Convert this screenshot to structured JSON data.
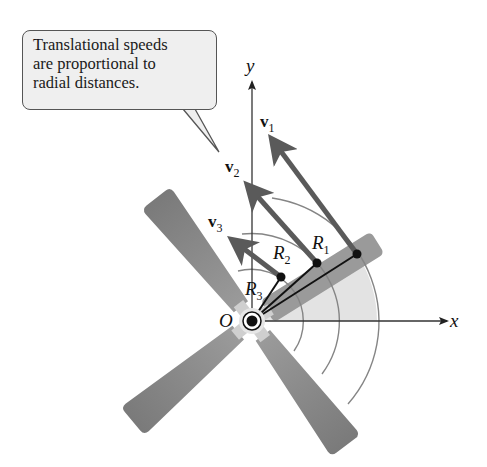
{
  "callout": {
    "lines": [
      "Translational speeds",
      "are proportional to",
      "radial distances."
    ]
  },
  "axes": {
    "x_label": "x",
    "y_label": "y",
    "origin_label": "O"
  },
  "vectors": [
    {
      "name": "v",
      "sub": "1"
    },
    {
      "name": "v",
      "sub": "2"
    },
    {
      "name": "v",
      "sub": "3"
    }
  ],
  "radii": [
    {
      "name": "R",
      "sub": "1"
    },
    {
      "name": "R",
      "sub": "2"
    },
    {
      "name": "R",
      "sub": "3"
    }
  ],
  "colors": {
    "blade": "#8a8a8a",
    "blade_light": "#a9a9a9",
    "shade": "#e2e2e2",
    "arrow": "#5a5a5a",
    "arc": "#808080",
    "axis": "#333333"
  }
}
